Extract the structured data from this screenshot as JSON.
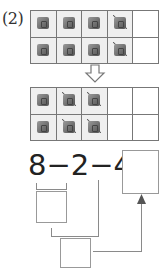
{
  "problem": {
    "label": "(2)",
    "top_grid": {
      "columns": 5,
      "rows": [
        [
          "cube",
          "cube",
          "cube",
          "crossed-cube",
          "empty"
        ],
        [
          "cube",
          "cube",
          "cube",
          "crossed-cube",
          "empty"
        ]
      ]
    },
    "transition_icon": "down-arrow-icon",
    "bottom_grid": {
      "columns": 5,
      "rows": [
        [
          "cube",
          "crossed-cube",
          "crossed-cube",
          "empty",
          "empty"
        ],
        [
          "cube",
          "crossed-cube",
          "crossed-cube",
          "empty",
          "empty"
        ]
      ]
    },
    "equation": {
      "text": "8−2−4=",
      "terms": [
        "8",
        "2",
        "4"
      ],
      "operators": [
        "−",
        "−",
        "="
      ],
      "answer": ""
    },
    "intermediate_boxes": [
      {
        "id": "step1",
        "value": ""
      },
      {
        "id": "step2",
        "value": ""
      }
    ]
  }
}
